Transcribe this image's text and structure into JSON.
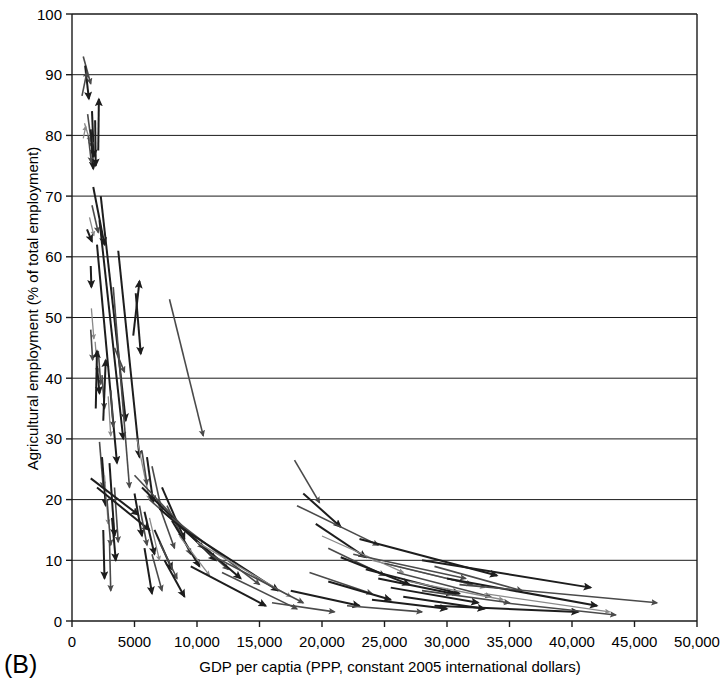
{
  "panel": {
    "label": "(B)"
  },
  "chart_data": {
    "type": "scatter",
    "title": "",
    "subtitle": "",
    "xlabel": "GDP per captia (PPP, constant 2005 international dollars)",
    "ylabel": "Agricultural employment (% of total employment)",
    "xlim": [
      0,
      50000
    ],
    "ylim": [
      0,
      100
    ],
    "xticks": [
      0,
      5000,
      10000,
      15000,
      20000,
      25000,
      30000,
      35000,
      40000,
      45000,
      50000
    ],
    "xticklabels": [
      "0",
      "5000",
      "10,000",
      "15,000",
      "20,000",
      "25,000",
      "30,000",
      "35,000",
      "40,000",
      "45,000",
      "50,000"
    ],
    "yticks": [
      0,
      10,
      20,
      30,
      40,
      50,
      60,
      70,
      80,
      90,
      100
    ],
    "yticklabels": [
      "0",
      "10",
      "20",
      "30",
      "40",
      "50",
      "60",
      "70",
      "80",
      "90",
      "100"
    ],
    "grid": "horizontal",
    "legend": "none",
    "marker": "arrow",
    "colors": {
      "dark": "#1d1d1d",
      "mid": "#4a4a4a",
      "light": "#8a8a8a"
    },
    "arrows": [
      {
        "x1": 900,
        "y1": 93.0,
        "x2": 1500,
        "y2": 88.5,
        "c": "mid"
      },
      {
        "x1": 1050,
        "y1": 91.5,
        "x2": 1350,
        "y2": 86.0,
        "c": "dark"
      },
      {
        "x1": 800,
        "y1": 86.5,
        "x2": 1200,
        "y2": 90.5,
        "c": "mid"
      },
      {
        "x1": 1600,
        "y1": 84.0,
        "x2": 1750,
        "y2": 76.5,
        "c": "dark"
      },
      {
        "x1": 2100,
        "y1": 77.5,
        "x2": 2150,
        "y2": 86.0,
        "c": "dark"
      },
      {
        "x1": 1000,
        "y1": 82.0,
        "x2": 1450,
        "y2": 79.0,
        "c": "light"
      },
      {
        "x1": 1250,
        "y1": 83.5,
        "x2": 1600,
        "y2": 78.0,
        "c": "mid"
      },
      {
        "x1": 1500,
        "y1": 81.0,
        "x2": 1700,
        "y2": 74.5,
        "c": "dark"
      },
      {
        "x1": 1300,
        "y1": 80.0,
        "x2": 1550,
        "y2": 75.5,
        "c": "mid"
      },
      {
        "x1": 1850,
        "y1": 82.5,
        "x2": 1900,
        "y2": 75.0,
        "c": "dark"
      },
      {
        "x1": 900,
        "y1": 79.5,
        "x2": 1100,
        "y2": 81.5,
        "c": "light"
      },
      {
        "x1": 1700,
        "y1": 71.5,
        "x2": 2600,
        "y2": 62.0,
        "c": "dark"
      },
      {
        "x1": 1600,
        "y1": 68.5,
        "x2": 2100,
        "y2": 64.0,
        "c": "mid"
      },
      {
        "x1": 1400,
        "y1": 66.5,
        "x2": 1750,
        "y2": 63.5,
        "c": "light"
      },
      {
        "x1": 1200,
        "y1": 64.5,
        "x2": 1600,
        "y2": 62.5,
        "c": "dark"
      },
      {
        "x1": 1500,
        "y1": 58.5,
        "x2": 1550,
        "y2": 55.0,
        "c": "dark"
      },
      {
        "x1": 2300,
        "y1": 70.0,
        "x2": 4300,
        "y2": 33.0,
        "c": "dark"
      },
      {
        "x1": 2200,
        "y1": 66.0,
        "x2": 4100,
        "y2": 30.0,
        "c": "dark"
      },
      {
        "x1": 2000,
        "y1": 62.0,
        "x2": 3600,
        "y2": 26.0,
        "c": "dark"
      },
      {
        "x1": 3700,
        "y1": 61.0,
        "x2": 5400,
        "y2": 27.0,
        "c": "dark"
      },
      {
        "x1": 3300,
        "y1": 55.0,
        "x2": 4600,
        "y2": 22.0,
        "c": "mid"
      },
      {
        "x1": 1550,
        "y1": 51.5,
        "x2": 1750,
        "y2": 46.5,
        "c": "light"
      },
      {
        "x1": 1500,
        "y1": 48.0,
        "x2": 1650,
        "y2": 43.0,
        "c": "mid"
      },
      {
        "x1": 1850,
        "y1": 46.0,
        "x2": 2050,
        "y2": 41.0,
        "c": "light"
      },
      {
        "x1": 2100,
        "y1": 44.5,
        "x2": 2300,
        "y2": 39.0,
        "c": "mid"
      },
      {
        "x1": 2000,
        "y1": 42.0,
        "x2": 2200,
        "y2": 37.5,
        "c": "dark"
      },
      {
        "x1": 2400,
        "y1": 40.5,
        "x2": 2600,
        "y2": 35.0,
        "c": "mid"
      },
      {
        "x1": 1900,
        "y1": 35.0,
        "x2": 2000,
        "y2": 44.5,
        "c": "dark"
      },
      {
        "x1": 2500,
        "y1": 33.0,
        "x2": 2700,
        "y2": 43.0,
        "c": "dark"
      },
      {
        "x1": 3100,
        "y1": 38.0,
        "x2": 3300,
        "y2": 32.0,
        "c": "mid"
      },
      {
        "x1": 2900,
        "y1": 37.0,
        "x2": 3100,
        "y2": 30.5,
        "c": "light"
      },
      {
        "x1": 4900,
        "y1": 47.0,
        "x2": 5400,
        "y2": 56.0,
        "c": "dark"
      },
      {
        "x1": 5100,
        "y1": 54.0,
        "x2": 5500,
        "y2": 44.0,
        "c": "dark"
      },
      {
        "x1": 7800,
        "y1": 53.0,
        "x2": 10500,
        "y2": 30.5,
        "c": "mid"
      },
      {
        "x1": 3400,
        "y1": 45.0,
        "x2": 4200,
        "y2": 41.0,
        "c": "mid"
      },
      {
        "x1": 2200,
        "y1": 29.5,
        "x2": 2500,
        "y2": 22.0,
        "c": "mid"
      },
      {
        "x1": 2400,
        "y1": 27.0,
        "x2": 2700,
        "y2": 19.0,
        "c": "dark"
      },
      {
        "x1": 2600,
        "y1": 24.0,
        "x2": 2900,
        "y2": 16.0,
        "c": "light"
      },
      {
        "x1": 3000,
        "y1": 26.0,
        "x2": 3400,
        "y2": 14.0,
        "c": "dark"
      },
      {
        "x1": 2800,
        "y1": 20.0,
        "x2": 3100,
        "y2": 12.5,
        "c": "mid"
      },
      {
        "x1": 3200,
        "y1": 17.0,
        "x2": 3500,
        "y2": 10.0,
        "c": "dark"
      },
      {
        "x1": 3400,
        "y1": 22.0,
        "x2": 3700,
        "y2": 13.0,
        "c": "mid"
      },
      {
        "x1": 2500,
        "y1": 15.0,
        "x2": 2600,
        "y2": 7.0,
        "c": "dark"
      },
      {
        "x1": 3000,
        "y1": 13.0,
        "x2": 3100,
        "y2": 5.0,
        "c": "mid"
      },
      {
        "x1": 1500,
        "y1": 23.5,
        "x2": 5300,
        "y2": 17.5,
        "c": "dark"
      },
      {
        "x1": 2000,
        "y1": 22.0,
        "x2": 6200,
        "y2": 15.0,
        "c": "dark"
      },
      {
        "x1": 5200,
        "y1": 30.0,
        "x2": 6200,
        "y2": 20.0,
        "c": "light"
      },
      {
        "x1": 5600,
        "y1": 28.0,
        "x2": 6000,
        "y2": 22.5,
        "c": "mid"
      },
      {
        "x1": 6000,
        "y1": 27.0,
        "x2": 6500,
        "y2": 19.5,
        "c": "dark"
      },
      {
        "x1": 6400,
        "y1": 25.5,
        "x2": 7200,
        "y2": 18.0,
        "c": "mid"
      },
      {
        "x1": 5000,
        "y1": 21.0,
        "x2": 5600,
        "y2": 14.0,
        "c": "dark"
      },
      {
        "x1": 5400,
        "y1": 19.0,
        "x2": 6000,
        "y2": 12.5,
        "c": "mid"
      },
      {
        "x1": 5800,
        "y1": 18.0,
        "x2": 6600,
        "y2": 11.0,
        "c": "dark"
      },
      {
        "x1": 6200,
        "y1": 17.0,
        "x2": 7000,
        "y2": 10.0,
        "c": "light"
      },
      {
        "x1": 6800,
        "y1": 20.0,
        "x2": 8200,
        "y2": 12.0,
        "c": "mid"
      },
      {
        "x1": 7200,
        "y1": 22.0,
        "x2": 9000,
        "y2": 13.5,
        "c": "dark"
      },
      {
        "x1": 7600,
        "y1": 19.0,
        "x2": 9500,
        "y2": 11.0,
        "c": "mid"
      },
      {
        "x1": 6600,
        "y1": 15.0,
        "x2": 8000,
        "y2": 8.5,
        "c": "dark"
      },
      {
        "x1": 7000,
        "y1": 13.0,
        "x2": 8400,
        "y2": 7.0,
        "c": "mid"
      },
      {
        "x1": 8000,
        "y1": 16.5,
        "x2": 10200,
        "y2": 9.0,
        "c": "dark"
      },
      {
        "x1": 8600,
        "y1": 14.0,
        "x2": 11000,
        "y2": 7.5,
        "c": "light"
      },
      {
        "x1": 5800,
        "y1": 12.0,
        "x2": 6400,
        "y2": 4.5,
        "c": "dark"
      },
      {
        "x1": 6400,
        "y1": 11.0,
        "x2": 7200,
        "y2": 5.0,
        "c": "mid"
      },
      {
        "x1": 7400,
        "y1": 10.0,
        "x2": 9000,
        "y2": 4.0,
        "c": "dark"
      },
      {
        "x1": 5000,
        "y1": 24.0,
        "x2": 10500,
        "y2": 12.0,
        "c": "mid"
      },
      {
        "x1": 5600,
        "y1": 22.0,
        "x2": 11500,
        "y2": 10.0,
        "c": "dark"
      },
      {
        "x1": 6200,
        "y1": 20.0,
        "x2": 12500,
        "y2": 8.5,
        "c": "mid"
      },
      {
        "x1": 7000,
        "y1": 18.5,
        "x2": 13500,
        "y2": 7.0,
        "c": "dark"
      },
      {
        "x1": 8000,
        "y1": 17.0,
        "x2": 15000,
        "y2": 6.0,
        "c": "mid"
      },
      {
        "x1": 9000,
        "y1": 15.0,
        "x2": 16500,
        "y2": 5.0,
        "c": "dark"
      },
      {
        "x1": 10000,
        "y1": 13.0,
        "x2": 17500,
        "y2": 4.0,
        "c": "light"
      },
      {
        "x1": 11000,
        "y1": 11.0,
        "x2": 18500,
        "y2": 3.0,
        "c": "mid"
      },
      {
        "x1": 9500,
        "y1": 9.0,
        "x2": 15500,
        "y2": 2.5,
        "c": "dark"
      },
      {
        "x1": 12000,
        "y1": 8.0,
        "x2": 18000,
        "y2": 2.0,
        "c": "mid"
      },
      {
        "x1": 17800,
        "y1": 26.5,
        "x2": 19800,
        "y2": 19.5,
        "c": "mid"
      },
      {
        "x1": 18500,
        "y1": 21.0,
        "x2": 21500,
        "y2": 15.5,
        "c": "dark"
      },
      {
        "x1": 18000,
        "y1": 19.0,
        "x2": 24500,
        "y2": 12.5,
        "c": "mid"
      },
      {
        "x1": 19500,
        "y1": 16.0,
        "x2": 23500,
        "y2": 10.5,
        "c": "dark"
      },
      {
        "x1": 20000,
        "y1": 14.0,
        "x2": 26500,
        "y2": 8.0,
        "c": "light"
      },
      {
        "x1": 20500,
        "y1": 12.0,
        "x2": 25000,
        "y2": 7.5,
        "c": "mid"
      },
      {
        "x1": 21500,
        "y1": 10.5,
        "x2": 27000,
        "y2": 6.0,
        "c": "dark"
      },
      {
        "x1": 19000,
        "y1": 8.0,
        "x2": 24000,
        "y2": 4.5,
        "c": "mid"
      },
      {
        "x1": 20500,
        "y1": 6.5,
        "x2": 25500,
        "y2": 3.5,
        "c": "dark"
      },
      {
        "x1": 17500,
        "y1": 5.0,
        "x2": 23000,
        "y2": 2.5,
        "c": "dark"
      },
      {
        "x1": 16000,
        "y1": 3.0,
        "x2": 21000,
        "y2": 1.5,
        "c": "mid"
      },
      {
        "x1": 23000,
        "y1": 13.5,
        "x2": 34000,
        "y2": 7.5,
        "c": "dark"
      },
      {
        "x1": 22500,
        "y1": 11.0,
        "x2": 31500,
        "y2": 7.0,
        "c": "mid"
      },
      {
        "x1": 24000,
        "y1": 10.0,
        "x2": 33000,
        "y2": 5.5,
        "c": "light"
      },
      {
        "x1": 25000,
        "y1": 9.5,
        "x2": 32000,
        "y2": 6.0,
        "c": "mid"
      },
      {
        "x1": 23500,
        "y1": 8.5,
        "x2": 31000,
        "y2": 4.5,
        "c": "dark"
      },
      {
        "x1": 26000,
        "y1": 8.0,
        "x2": 33500,
        "y2": 4.0,
        "c": "mid"
      },
      {
        "x1": 24500,
        "y1": 7.0,
        "x2": 30500,
        "y2": 4.5,
        "c": "dark"
      },
      {
        "x1": 27000,
        "y1": 6.5,
        "x2": 34500,
        "y2": 3.5,
        "c": "light"
      },
      {
        "x1": 25500,
        "y1": 5.5,
        "x2": 32500,
        "y2": 3.0,
        "c": "dark"
      },
      {
        "x1": 28000,
        "y1": 5.0,
        "x2": 35000,
        "y2": 3.0,
        "c": "mid"
      },
      {
        "x1": 26500,
        "y1": 4.0,
        "x2": 33000,
        "y2": 2.0,
        "c": "dark"
      },
      {
        "x1": 29000,
        "y1": 9.0,
        "x2": 36000,
        "y2": 5.0,
        "c": "mid"
      },
      {
        "x1": 24000,
        "y1": 3.5,
        "x2": 30000,
        "y2": 2.0,
        "c": "dark"
      },
      {
        "x1": 22000,
        "y1": 2.5,
        "x2": 28000,
        "y2": 1.5,
        "c": "mid"
      },
      {
        "x1": 28000,
        "y1": 10.0,
        "x2": 41500,
        "y2": 5.5,
        "c": "dark"
      },
      {
        "x1": 30000,
        "y1": 7.0,
        "x2": 42000,
        "y2": 2.5,
        "c": "dark"
      },
      {
        "x1": 31000,
        "y1": 6.0,
        "x2": 46800,
        "y2": 3.0,
        "c": "mid"
      },
      {
        "x1": 33000,
        "y1": 4.5,
        "x2": 43000,
        "y2": 1.5,
        "c": "light"
      },
      {
        "x1": 29000,
        "y1": 2.5,
        "x2": 40500,
        "y2": 1.5,
        "c": "dark"
      },
      {
        "x1": 34500,
        "y1": 3.0,
        "x2": 43500,
        "y2": 1.0,
        "c": "mid"
      }
    ]
  }
}
